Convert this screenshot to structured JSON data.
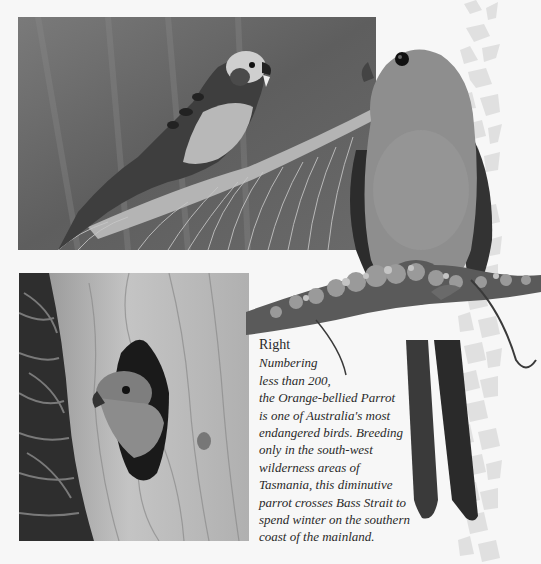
{
  "page": {
    "background": "#f7f7f7"
  },
  "photos": {
    "top_left": {
      "subject": "Parrot perched on a branch among pine needles",
      "tone": "grayscale"
    },
    "bottom_left": {
      "subject": "Orange-bellied Parrot peering out of a tree hollow",
      "tone": "grayscale"
    },
    "cutout": {
      "subject": "Orange-bellied Parrot perched on a lichen-covered branch",
      "tone": "grayscale"
    }
  },
  "decoration": {
    "strip_icon": "bird-silhouette-pattern",
    "strip_color": "#e2e2e2"
  },
  "caption": {
    "heading": "Right",
    "lines": [
      "Numbering",
      "less than 200,",
      "the Orange-bellied Parrot",
      "is one of Australia's most",
      "endangered birds. Breeding",
      "only in the south-west",
      "wilderness areas of",
      "Tasmania, this diminutive",
      "parrot crosses Bass Strait to",
      "spend winter on the southern",
      "coast of the mainland."
    ]
  }
}
